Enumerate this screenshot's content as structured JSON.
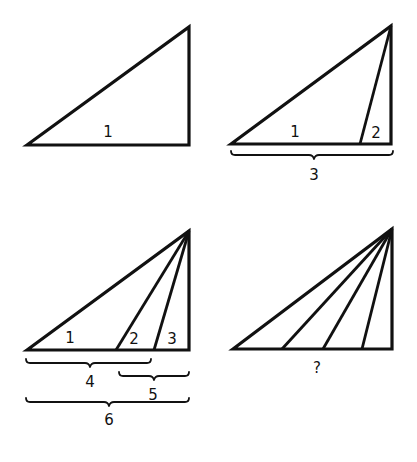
{
  "diagram": {
    "panels": [
      {
        "id": "panel-1",
        "triangle_labels": [
          {
            "text": "1"
          }
        ],
        "braces": []
      },
      {
        "id": "panel-2",
        "triangle_labels": [
          {
            "text": "1"
          },
          {
            "text": "2"
          }
        ],
        "braces": [
          {
            "label": "3"
          }
        ]
      },
      {
        "id": "panel-3",
        "triangle_labels": [
          {
            "text": "1"
          },
          {
            "text": "2"
          },
          {
            "text": "3"
          }
        ],
        "braces": [
          {
            "label": "4"
          },
          {
            "label": "5"
          },
          {
            "label": "6"
          }
        ]
      },
      {
        "id": "panel-4",
        "triangle_labels": [],
        "braces": [],
        "question_label": "?"
      }
    ],
    "colors": {
      "stroke": "#111111",
      "background": "#ffffff"
    }
  }
}
